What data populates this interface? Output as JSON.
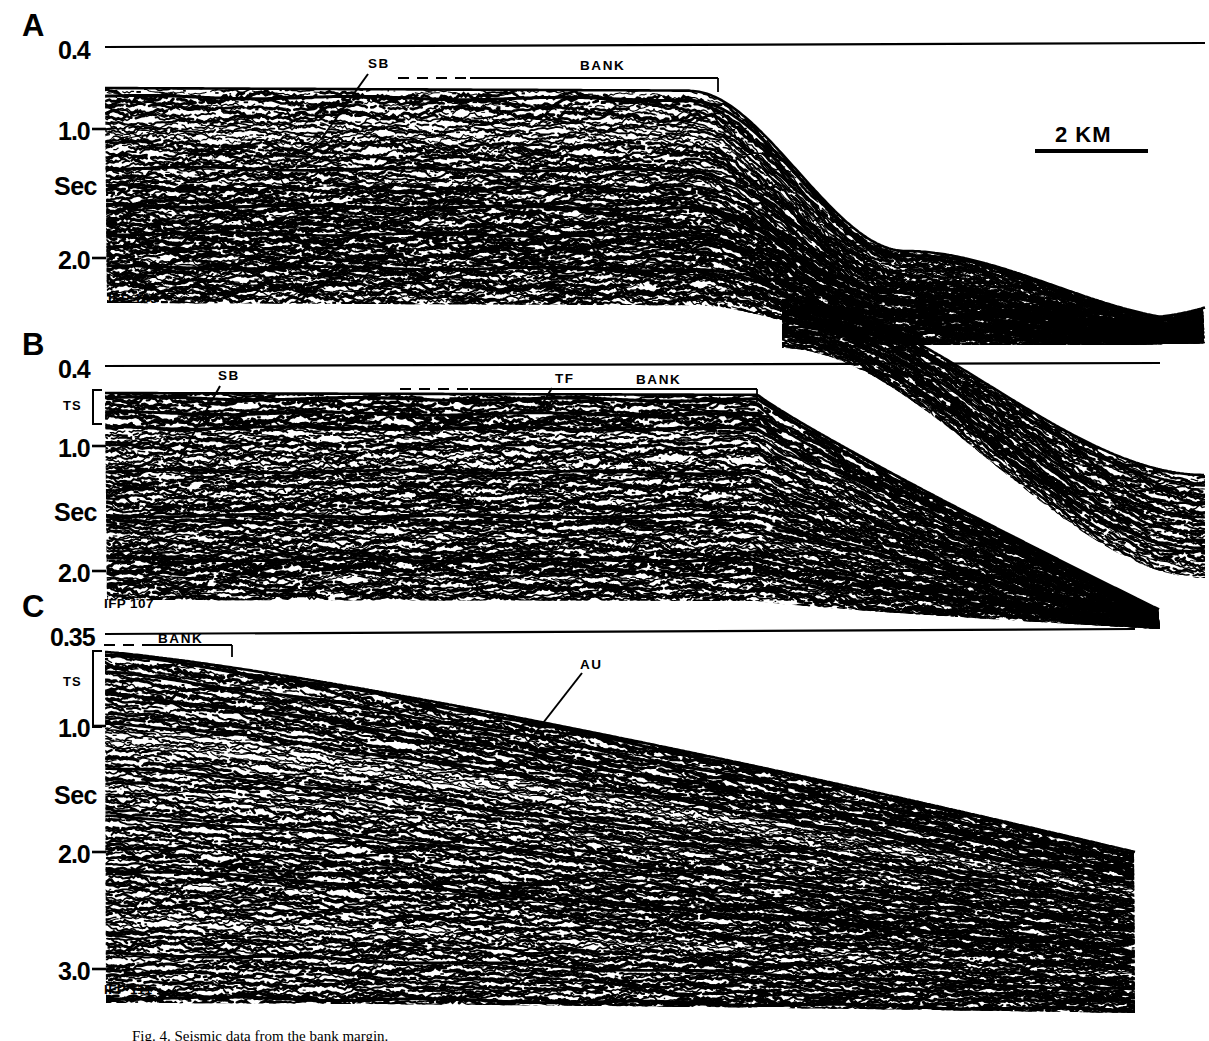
{
  "figure": {
    "type": "seismic-reflection-profiles",
    "background": "#ffffff",
    "ink": "#000000",
    "caption": "Fig. 4.  Seismic data from the bank margin."
  },
  "scale_bar": {
    "label": "2 KM",
    "x1": 1035,
    "x2": 1148,
    "y": 151,
    "text_x": 1055,
    "text_y": 122
  },
  "panels": [
    {
      "id": "A",
      "letter": "A",
      "survey_line": "IFP  103",
      "ifp_x": 108,
      "ifp_y": 291,
      "letter_x": 22,
      "letter_y": 8,
      "datum_label": "0.4",
      "axis_ticks": [
        {
          "label": "0.4",
          "x": 58,
          "y": 36,
          "tick": false
        },
        {
          "label": "1.0",
          "x": 58,
          "y": 117,
          "tick": true
        },
        {
          "label": "Sec",
          "x": 54,
          "y": 172,
          "tick": false
        },
        {
          "label": "2.0",
          "x": 58,
          "y": 246,
          "tick": true
        }
      ],
      "annotations": [
        {
          "name": "SB",
          "x": 368,
          "y": 56,
          "leader": [
            368,
            74,
            322,
            138
          ]
        },
        {
          "name": "BANK",
          "x": 580,
          "y": 58,
          "leader": null
        }
      ],
      "bracket": {
        "label": "BANK",
        "dash_x1": 398,
        "dash_x2": 470,
        "solid_x1": 470,
        "solid_x2": 718,
        "y": 78,
        "tick_down": 14
      }
    },
    {
      "id": "B",
      "letter": "B",
      "survey_line": "IFP  107",
      "ifp_x": 104,
      "ifp_y": 596,
      "letter_x": 22,
      "letter_y": 327,
      "datum_label": "0.4",
      "axis_ticks": [
        {
          "label": "0.4",
          "x": 58,
          "y": 355,
          "tick": false
        },
        {
          "label": "1.0",
          "x": 58,
          "y": 434,
          "tick": true
        },
        {
          "label": "Sec",
          "x": 54,
          "y": 498,
          "tick": false
        },
        {
          "label": "2.0",
          "x": 58,
          "y": 559,
          "tick": true
        }
      ],
      "ts_bracket": {
        "label": "TS",
        "label_x": 63,
        "label_y": 398,
        "x": 93,
        "y1": 390,
        "y2": 424
      },
      "annotations": [
        {
          "name": "SB",
          "x": 218,
          "y": 368,
          "leader": [
            220,
            386,
            176,
            465
          ]
        },
        {
          "name": "TF",
          "x": 555,
          "y": 371,
          "leader": [
            552,
            388,
            538,
            411
          ]
        },
        {
          "name": "BANK",
          "x": 636,
          "y": 372,
          "leader": null
        }
      ],
      "bracket": {
        "label": "BANK",
        "dash_x1": 400,
        "dash_x2": 470,
        "solid_x1": 470,
        "solid_x2": 757,
        "y": 389,
        "tick_down": 13
      }
    },
    {
      "id": "C",
      "letter": "C",
      "survey_line": "IFP  111",
      "ifp_x": 104,
      "ifp_y": 982,
      "letter_x": 22,
      "letter_y": 589,
      "datum_label": "0.35",
      "axis_ticks": [
        {
          "label": "0.35",
          "x": 50,
          "y": 623,
          "tick": false
        },
        {
          "label": "1.0",
          "x": 58,
          "y": 714,
          "tick": true
        },
        {
          "label": "Sec",
          "x": 54,
          "y": 781,
          "tick": false
        },
        {
          "label": "2.0",
          "x": 58,
          "y": 840,
          "tick": true
        },
        {
          "label": "3.0",
          "x": 58,
          "y": 957,
          "tick": true
        }
      ],
      "ts_bracket": {
        "label": "TS",
        "label_x": 63,
        "label_y": 674,
        "x": 93,
        "y1": 651,
        "y2": 727
      },
      "annotations": [
        {
          "name": "AU",
          "x": 580,
          "y": 657,
          "leader": [
            582,
            673,
            522,
            750
          ]
        }
      ],
      "bracket": {
        "label": "BANK",
        "dash_x1": 104,
        "dash_x2": 150,
        "solid_x1": 150,
        "solid_x2": 232,
        "y": 645,
        "tick_down": 12,
        "label_x": 158,
        "label_y": 631
      }
    }
  ],
  "chart_data": {
    "type": "line",
    "xlabel": "",
    "ylabel": "Sec",
    "profiles": [
      {
        "panel": "A",
        "line": "IFP 103",
        "two_way_time_range_sec": [
          0.4,
          2.3
        ],
        "ytick_values": [
          0.4,
          1.0,
          2.0
        ],
        "seafloor_sec": [
          0.78,
          0.78,
          0.79,
          0.8,
          1.05,
          1.55,
          2.05,
          2.3,
          2.35
        ],
        "features": [
          "SB",
          "BANK",
          "prograding clinoforms",
          "slope"
        ]
      },
      {
        "panel": "B",
        "line": "IFP 107",
        "two_way_time_range_sec": [
          0.4,
          2.2
        ],
        "ytick_values": [
          0.4,
          1.0,
          2.0
        ],
        "seafloor_sec": [
          0.62,
          0.62,
          0.63,
          0.64,
          0.95,
          1.45,
          1.95,
          2.15
        ],
        "features": [
          "SB",
          "TF",
          "BANK",
          "TS",
          "slope"
        ]
      },
      {
        "panel": "C",
        "line": "IFP 111",
        "two_way_time_range_sec": [
          0.35,
          3.1
        ],
        "ytick_values": [
          0.35,
          1.0,
          2.0,
          3.0
        ],
        "seafloor_sec": [
          0.46,
          0.52,
          0.6,
          0.72,
          0.9,
          1.15,
          1.4
        ],
        "features": [
          "BANK",
          "TS",
          "AU",
          "dipping reflectors"
        ]
      }
    ],
    "scale_bar_km": 2,
    "grid": false,
    "legend": "none"
  }
}
